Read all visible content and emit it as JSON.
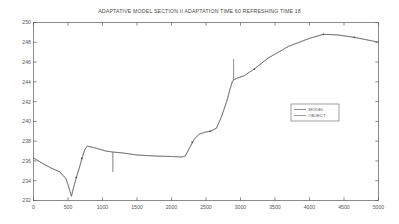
{
  "chart_data": {
    "type": "line",
    "title": "ADAPTATIVE MODEL SECTION II ADAPTATION TIME 60 REFRESHING TIME 18",
    "xlabel": "",
    "ylabel": "",
    "xlim": [
      0,
      5000
    ],
    "ylim": [
      232,
      250
    ],
    "grid": false,
    "xticks": [
      0,
      500,
      1000,
      1500,
      2000,
      2500,
      3000,
      3500,
      4000,
      4500,
      5000
    ],
    "yticks": [
      232,
      234,
      236,
      238,
      240,
      242,
      244,
      246,
      248,
      250
    ],
    "legend": {
      "position": "center-right",
      "entries": [
        {
          "name": "MODEL",
          "color": "#5a5a5a"
        },
        {
          "name": "OBJECT",
          "color": "#777777"
        }
      ]
    },
    "series": [
      {
        "name": "OBJECT",
        "color": "#888888",
        "x": [
          0,
          120,
          250,
          380,
          470,
          500,
          530,
          550,
          580,
          620,
          660,
          700,
          740,
          780,
          900,
          1050,
          1150,
          1150,
          1150,
          1300,
          1500,
          1750,
          2000,
          2150,
          2200,
          2260,
          2330,
          2400,
          2480,
          2560,
          2650,
          2720,
          2800,
          2850,
          2880,
          2900,
          2900,
          2900,
          2960,
          3050,
          3200,
          3400,
          3700,
          4000,
          4200,
          4400,
          4650,
          4900,
          5000
        ],
        "y": [
          236.3,
          235.8,
          235.3,
          234.9,
          234.2,
          233.6,
          232.9,
          232.4,
          233.3,
          234.3,
          235.2,
          236.2,
          237.1,
          237.5,
          237.3,
          237.0,
          236.9,
          234.9,
          236.9,
          236.8,
          236.6,
          236.5,
          236.45,
          236.4,
          236.5,
          237.3,
          238.2,
          238.7,
          238.9,
          239.0,
          239.3,
          240.4,
          242.0,
          243.3,
          244.0,
          244.2,
          246.3,
          244.2,
          244.4,
          244.6,
          245.3,
          246.4,
          247.6,
          248.4,
          248.8,
          248.75,
          248.5,
          248.15,
          248.0
        ]
      },
      {
        "name": "MODEL",
        "color": "#5a5a5a",
        "x": [
          0,
          120,
          250,
          380,
          470,
          500,
          530,
          550,
          580,
          620,
          660,
          700,
          740,
          780,
          900,
          1050,
          1150,
          1300,
          1500,
          1750,
          2000,
          2150,
          2200,
          2260,
          2330,
          2400,
          2480,
          2560,
          2650,
          2720,
          2800,
          2850,
          2880,
          2900,
          2960,
          3050,
          3200,
          3400,
          3700,
          4000,
          4200,
          4400,
          4650,
          4900,
          5000
        ],
        "y": [
          236.3,
          235.8,
          235.3,
          234.9,
          234.2,
          233.6,
          232.9,
          232.45,
          233.3,
          234.3,
          235.2,
          236.2,
          237.1,
          237.5,
          237.3,
          237.0,
          236.9,
          236.8,
          236.6,
          236.5,
          236.45,
          236.4,
          236.5,
          237.3,
          238.2,
          238.7,
          238.9,
          239.0,
          239.3,
          240.4,
          242.0,
          243.3,
          244.0,
          244.2,
          244.4,
          244.6,
          245.3,
          246.4,
          247.6,
          248.4,
          248.8,
          248.75,
          248.5,
          248.15,
          248.0
        ]
      }
    ],
    "markers": [
      {
        "x": 620,
        "y": 234.35
      },
      {
        "x": 700,
        "y": 236.25
      },
      {
        "x": 2300,
        "y": 237.9
      },
      {
        "x": 2560,
        "y": 239.0
      },
      {
        "x": 3200,
        "y": 245.3
      },
      {
        "x": 4200,
        "y": 248.8
      },
      {
        "x": 4650,
        "y": 248.5
      }
    ],
    "axis_color": "#5a5a5a",
    "background": "#ffffff"
  }
}
